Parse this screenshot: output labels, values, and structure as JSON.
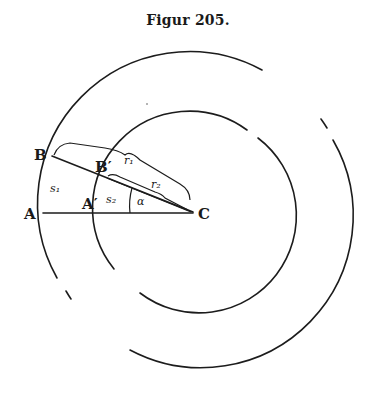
{
  "figure": {
    "title": "Figur 205.",
    "points": {
      "A": "A",
      "A_prime": "A′",
      "B": "B",
      "B_prime": "B′",
      "C": "C"
    },
    "symbols": {
      "s1": "s₁",
      "s2": "s₂",
      "r1": "r₁",
      "r2": "r₂",
      "alpha": "α"
    },
    "geometry": {
      "center": [
        195,
        213
      ],
      "outer_radius": 152,
      "inner_radius": 97,
      "angle_alpha_deg": 21
    },
    "colors": {
      "ink": "#1c1c1c",
      "paper": "#ffffff"
    }
  }
}
